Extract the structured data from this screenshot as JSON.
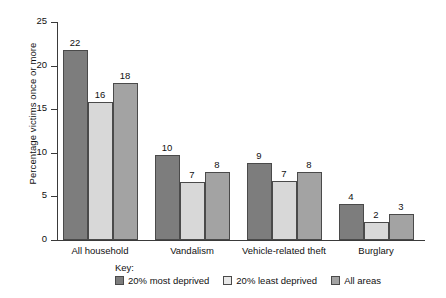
{
  "chart_data": {
    "type": "bar",
    "title": "",
    "xlabel": "",
    "ylabel": "Percentage victims once or more",
    "ylim": [
      0,
      25
    ],
    "yticks": [
      0,
      5,
      10,
      15,
      20,
      25
    ],
    "ytick_labels": [
      "0",
      "5",
      "10",
      "15",
      "20",
      "25"
    ],
    "grid": false,
    "legend_position": "bottom",
    "legend_title": "Key:",
    "categories": [
      "All household",
      "Vandalism",
      "Vehicle-related theft",
      "Burglary"
    ],
    "series": [
      {
        "name": "20% most deprived",
        "color": "#7d7d7d",
        "values": [
          22,
          10,
          9,
          4
        ],
        "plotted": [
          21.8,
          9.7,
          8.8,
          4.1
        ],
        "labels": [
          "22",
          "10",
          "9",
          "4"
        ]
      },
      {
        "name": "20% least deprived",
        "color": "#d8d8d8",
        "values": [
          16,
          7,
          7,
          2
        ],
        "plotted": [
          15.8,
          6.7,
          6.8,
          2.1
        ],
        "labels": [
          "16",
          "7",
          "7",
          "2"
        ]
      },
      {
        "name": "All areas",
        "color": "#a3a3a3",
        "values": [
          18,
          8,
          8,
          3
        ],
        "plotted": [
          18.0,
          7.8,
          7.8,
          3.0
        ],
        "labels": [
          "18",
          "8",
          "8",
          "3"
        ]
      }
    ]
  }
}
